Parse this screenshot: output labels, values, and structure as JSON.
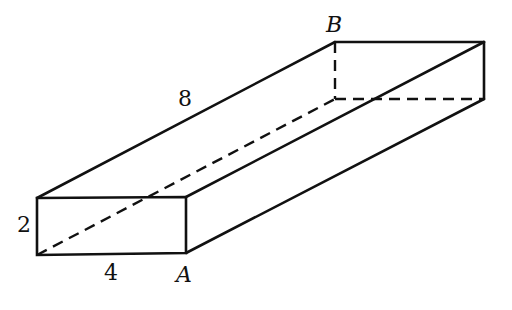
{
  "figure": {
    "type": "rectangular-prism",
    "colors": {
      "line": "#111111",
      "background": "#ffffff"
    },
    "vertices": {
      "front_top_left": [
        37,
        198
      ],
      "front_top_right": [
        186,
        197
      ],
      "front_bottom_left": [
        37,
        255
      ],
      "front_bottom_right_A": [
        186,
        253
      ],
      "back_top_left_B": [
        335,
        42
      ],
      "back_top_right": [
        484,
        42
      ],
      "back_bottom_left": [
        335,
        99
      ],
      "back_bottom_right": [
        484,
        99
      ]
    },
    "labels": {
      "length": "8",
      "height": "2",
      "width": "4",
      "point_a": "A",
      "point_b": "B"
    }
  }
}
